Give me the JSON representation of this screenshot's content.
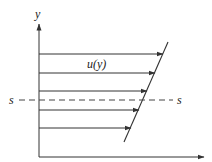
{
  "diagram": {
    "type": "velocity-profile",
    "y_axis": {
      "label": "y",
      "x": 39,
      "y_top": 24,
      "y_bottom": 157
    },
    "x_axis": {
      "label": "",
      "y": 157,
      "x_start": 39,
      "x_end": 204
    },
    "profile_label": "u(y)",
    "section_label_left": "s",
    "section_label_right": "s",
    "section_line": {
      "y": 100,
      "x_start": 19,
      "x_end": 173,
      "style": "dashed"
    },
    "profile_line": {
      "x1": 168,
      "y1": 42,
      "x2": 124,
      "y2": 142
    },
    "arrows": [
      {
        "y": 54,
        "x_end": 163
      },
      {
        "y": 73,
        "x_end": 155
      },
      {
        "y": 91,
        "x_end": 147
      },
      {
        "y": 110,
        "x_end": 139
      },
      {
        "y": 128,
        "x_end": 131
      }
    ],
    "colors": {
      "line": "#333333",
      "dashed": "#444444",
      "text": "#222222"
    }
  }
}
